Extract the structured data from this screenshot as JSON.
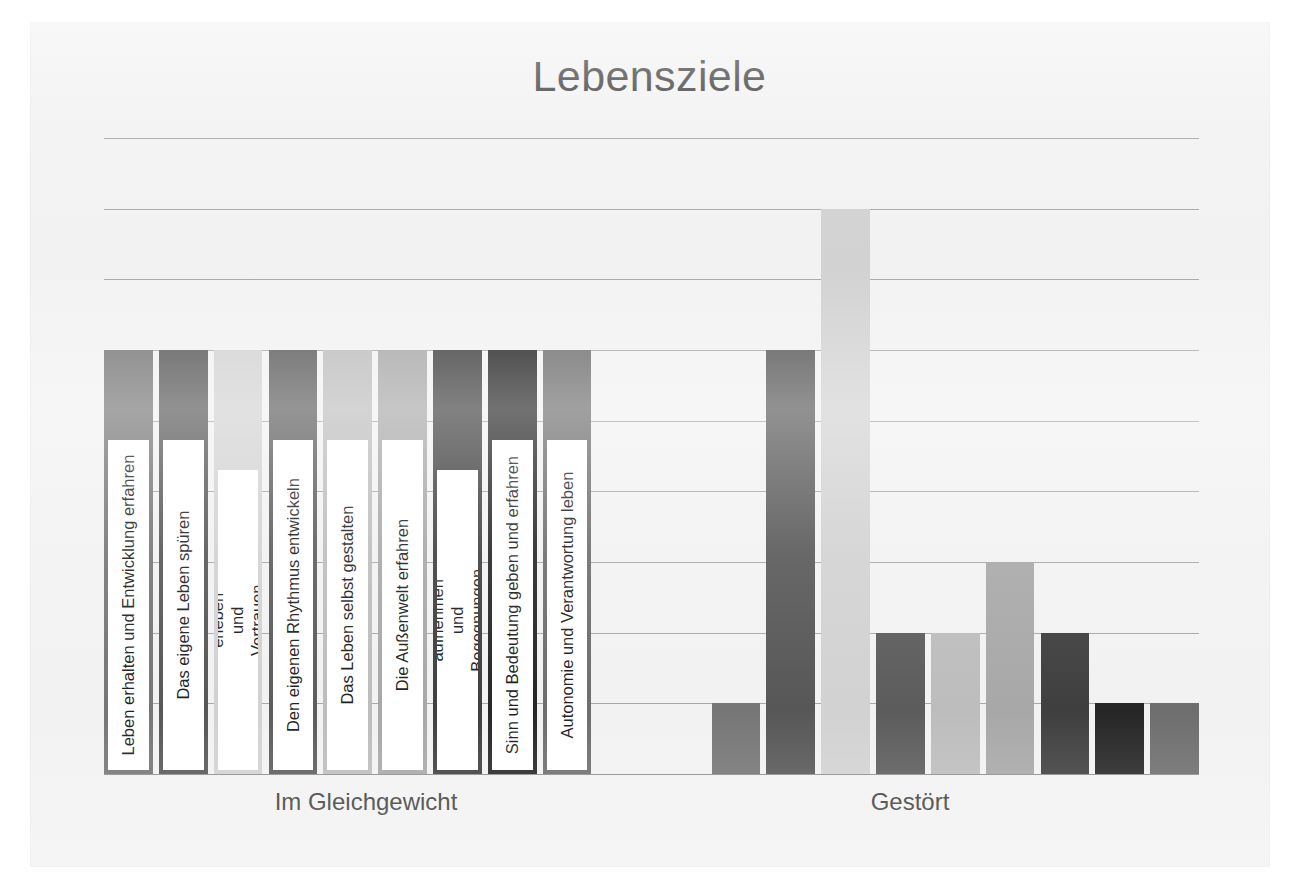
{
  "chart_data": {
    "type": "bar",
    "title": "Lebensziele",
    "xlabel": "",
    "ylabel": "",
    "grid": true,
    "legend_position": "none",
    "note": "Grouped bar chart; each group contains the 9 Lebensziele series. Values read off the horizontal gridlines (gridline spacing = 1 unit, baseline = 0, top gridline = 9).",
    "ylim": [
      0,
      9
    ],
    "gridlines": [
      1,
      2,
      3,
      4,
      5,
      6,
      7,
      8,
      9
    ],
    "categories": [
      "Im Gleichgewicht",
      "Gestört"
    ],
    "series": [
      {
        "name": "Leben erhalten und Entwicklung erfahren",
        "color": "#767676",
        "values": [
          6,
          1
        ]
      },
      {
        "name": "Das eigene Leben spüren",
        "color": "#575757",
        "values": [
          6,
          6
        ]
      },
      {
        "name": "Sicherheit erleben und Vertrauen aufbauen",
        "color": "#d2d2d2",
        "values": [
          6,
          8
        ]
      },
      {
        "name": "Den eigenen Rhythmus entwickeln",
        "color": "#5c5c5c",
        "values": [
          6,
          2
        ]
      },
      {
        "name": "Das Leben selbst gestalten",
        "color": "#bdbdbd",
        "values": [
          6,
          2
        ]
      },
      {
        "name": "Die Außenwelt erfahren",
        "color": "#a8a8a8",
        "values": [
          6,
          3
        ]
      },
      {
        "name": "Beziehungen aufnehmen und Begegnungen gestalten",
        "color": "#3f3f3f",
        "values": [
          6,
          2
        ]
      },
      {
        "name": "Sinn und Bedeutung geben und erfahren",
        "color": "#262626",
        "values": [
          6,
          1
        ]
      },
      {
        "name": "Autonomie und Verantwortung leben",
        "color": "#6e6e6e",
        "values": [
          6,
          1
        ]
      }
    ]
  },
  "axis": {
    "category_labels": [
      "Im Gleichgewicht",
      "Gestört"
    ]
  },
  "labels": {
    "bar_0": "Leben erhalten und Entwicklung erfahren",
    "bar_1": "Das eigene Leben spüren",
    "bar_2": "Sicherheit erleben und Vertrauen aufbauen",
    "bar_3": "Den eigenen Rhythmus entwickeln",
    "bar_4": "Das Leben selbst gestalten",
    "bar_5": "Die Außenwelt erfahren",
    "bar_6": "Beziehungen aufnehmen und Begegnungen gestalten",
    "bar_7": "Sinn und Bedeutung geben und erfahren",
    "bar_8": "Autonomie und Verantwortung leben"
  },
  "colors": {
    "background": "#f2f2f2",
    "title_text": "#3d3d3d",
    "gridline": "#a8a8a8",
    "label_plate": "#ffffff",
    "label_text": "#1f1f1f"
  }
}
